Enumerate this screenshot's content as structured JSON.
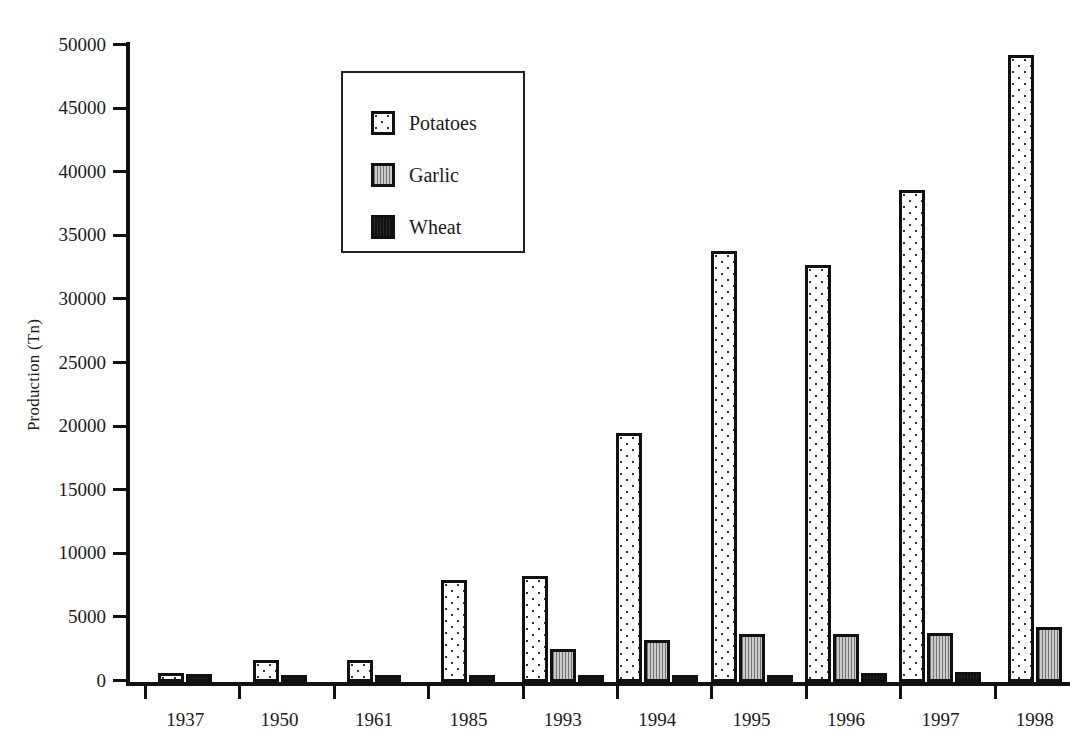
{
  "chart_data": {
    "type": "bar",
    "title": "",
    "xlabel": "",
    "ylabel": "Production (Tn)",
    "categories": [
      "1937",
      "1950",
      "1961",
      "1985",
      "1993",
      "1994",
      "1995",
      "1996",
      "1997",
      "1998"
    ],
    "series": [
      {
        "name": "Potatoes",
        "color": "#ffffff",
        "pattern": "dotted",
        "values": [
          700,
          1700,
          1700,
          8000,
          8300,
          19600,
          33900,
          32800,
          38700,
          49300
        ]
      },
      {
        "name": "Garlic",
        "color": "#b9b9b9",
        "pattern": "stippled-gray",
        "values": [
          0,
          0,
          0,
          0,
          2600,
          3300,
          3800,
          3800,
          3850,
          4300
        ]
      },
      {
        "name": "Wheat",
        "color": "#111111",
        "pattern": "solid-black",
        "values": [
          650,
          500,
          450,
          250,
          300,
          250,
          300,
          700,
          750,
          0
        ]
      }
    ],
    "ylim": [
      0,
      50000
    ],
    "yticks": [
      0,
      5000,
      10000,
      15000,
      20000,
      25000,
      30000,
      35000,
      40000,
      45000,
      50000
    ],
    "ytick_labels": [
      "0",
      "5000",
      "10000",
      "15000",
      "20000",
      "25000",
      "30000",
      "35000",
      "40000",
      "45000",
      "50000"
    ],
    "grid": false,
    "legend_position": "upper-left-inset"
  },
  "legend": {
    "entries": [
      {
        "label": "Potatoes"
      },
      {
        "label": "Garlic"
      },
      {
        "label": "Wheat"
      }
    ]
  }
}
